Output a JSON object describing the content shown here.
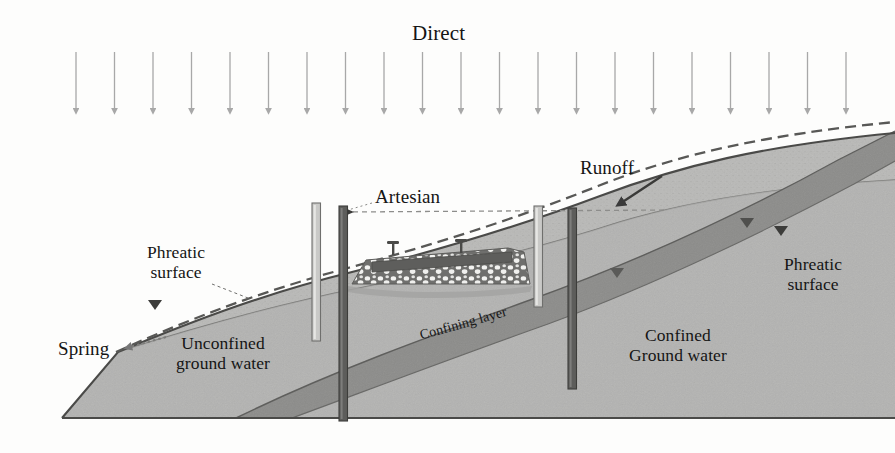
{
  "diagram": {
    "type": "cross-section",
    "width": 895,
    "height": 453
  },
  "labels": {
    "direct": "Direct",
    "runoff": "Runoff",
    "artesian": "Artesian",
    "phreatic_left": "Phreatic\nsurface",
    "phreatic_right": "Phreatic\nsurface",
    "spring": "Spring",
    "unconfined": "Unconfined\nground water",
    "confined": "Confined\nGround water",
    "confining_layer": "Confining layer"
  },
  "colors": {
    "background": "#fdfdfc",
    "arrow_gray": "#a8a8a8",
    "aquifer_fill": "#b9b9b7",
    "unsaturated_fill": "#ececea",
    "confining_fill": "#8e8e8c",
    "well_dark": "#5d5d5d",
    "well_light": "#c9c9c7",
    "outline": "#6a6a6a",
    "text": "#151515",
    "dam_deck": "#6d6d6b",
    "dam_rock": "#f2f2f0"
  },
  "precipitation": {
    "icon": "down-arrow-icon",
    "count": 21,
    "first_x": 76,
    "spacing": 38.5,
    "top_y": 52,
    "bottom_y": 112
  },
  "features": {
    "artesian_head_line": {
      "label": "artesian-pressure-line",
      "style": "dashed",
      "y": 212,
      "x_start": 344,
      "x_end": 660
    },
    "wells": [
      {
        "name": "well-unconfined-shallow",
        "x": 316,
        "top": 203,
        "bottom": 340,
        "shade": "light"
      },
      {
        "name": "well-unconfined-deep",
        "x": 344,
        "top": 206,
        "bottom": 420,
        "shade": "dark"
      },
      {
        "name": "well-confined-shallow",
        "x": 538,
        "top": 206,
        "bottom": 306,
        "shade": "light"
      },
      {
        "name": "well-artesian-deep",
        "x": 572,
        "top": 208,
        "bottom": 388,
        "shade": "dark"
      }
    ],
    "water_table_markers": [
      {
        "name": "water-table-triangle",
        "x": 154,
        "y": 303
      },
      {
        "name": "water-table-triangle",
        "x": 616,
        "y": 272
      },
      {
        "name": "water-table-triangle",
        "x": 746,
        "y": 222
      },
      {
        "name": "water-table-triangle",
        "x": 780,
        "y": 230
      }
    ],
    "dam": {
      "name": "embankment-dam",
      "x_left": 352,
      "x_right": 520,
      "crest_y": 250,
      "base_y": 285,
      "posts": 2
    },
    "spring_arrow": {
      "name": "spring-arrow",
      "style": "dotted",
      "from_x": 163,
      "from_y": 340,
      "to_x": 118,
      "to_y": 350
    },
    "runoff_arrow": {
      "name": "runoff-arrow",
      "from_x": 658,
      "from_y": 178,
      "to_x": 614,
      "to_y": 206
    }
  }
}
